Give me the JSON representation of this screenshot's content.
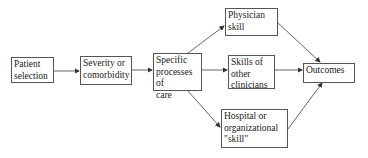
{
  "diagram": {
    "nodes": [
      {
        "id": "patient-selection",
        "label": "Patient\nselection"
      },
      {
        "id": "severity",
        "label": "Severity or\ncomorbidity"
      },
      {
        "id": "processes",
        "label": "Specific\nprocesses of\ncare"
      },
      {
        "id": "physician-skill",
        "label": "Physician\nskill"
      },
      {
        "id": "other-clinicians",
        "label": "Skills of\nother\nclinicians"
      },
      {
        "id": "hospital-skill",
        "label": "Hospital or\norganizational\n\"skill\""
      },
      {
        "id": "outcomes",
        "label": "Outcomes"
      }
    ],
    "edges": [
      {
        "from": "patient-selection",
        "to": "severity"
      },
      {
        "from": "severity",
        "to": "processes"
      },
      {
        "from": "processes",
        "to": "physician-skill"
      },
      {
        "from": "processes",
        "to": "other-clinicians"
      },
      {
        "from": "processes",
        "to": "hospital-skill"
      },
      {
        "from": "physician-skill",
        "to": "outcomes"
      },
      {
        "from": "other-clinicians",
        "to": "outcomes"
      },
      {
        "from": "hospital-skill",
        "to": "outcomes"
      }
    ],
    "colors": {
      "line": "#555555",
      "background": "#ffffff",
      "text": "#222222"
    }
  }
}
